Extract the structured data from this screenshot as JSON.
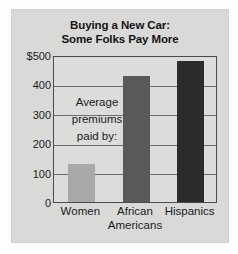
{
  "figure": {
    "title_line1": "Buying a New Car:",
    "title_line2": "Some Folks Pay More",
    "annotation_line1": "Average",
    "annotation_line2": "premiums",
    "annotation_line3": "paid by:",
    "panel_color": "#d9d9d7",
    "plot_bg_color": "#dcdcda",
    "axis_color": "#4a4a4a",
    "grid_color": "#6e6e6e"
  },
  "chart_data": {
    "type": "bar",
    "title": "Buying a New Car: Some Folks Pay More",
    "xlabel": "",
    "ylabel": "",
    "categories": [
      "Women",
      "African Americans",
      "Hispanics"
    ],
    "category_lines": [
      [
        "Women"
      ],
      [
        "African",
        "Americans"
      ],
      [
        "Hispanics"
      ]
    ],
    "values": [
      130,
      430,
      478
    ],
    "ylim": [
      0,
      500
    ],
    "yticks": [
      0,
      100,
      200,
      300,
      400,
      500
    ],
    "ytick_labels": [
      "0",
      "100",
      "200",
      "300",
      "400",
      "$500"
    ],
    "grid": true,
    "legend": false,
    "annotation": "Average premiums paid by:",
    "bar_colors": [
      "#a9a9a9",
      "#595959",
      "#2b2b2b"
    ]
  }
}
